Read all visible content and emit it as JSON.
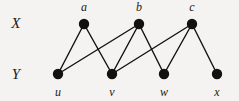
{
  "figure": {
    "type": "bipartite-graph",
    "background_color": "#f4f3f1",
    "ink_color": "#111111",
    "width": 239,
    "height": 101
  },
  "set_labels": [
    {
      "id": "X",
      "text": "X",
      "x": 16,
      "y": 23
    },
    {
      "id": "Y",
      "text": "Y",
      "x": 16,
      "y": 74
    }
  ],
  "vertices": {
    "top": [
      {
        "id": "a",
        "label": "a",
        "cx": 84,
        "cy": 24,
        "r": 5.2,
        "label_x": 84,
        "label_y": 7
      },
      {
        "id": "b",
        "label": "b",
        "cx": 139,
        "cy": 24,
        "r": 5.2,
        "label_x": 139,
        "label_y": 7
      },
      {
        "id": "c",
        "label": "c",
        "cx": 192,
        "cy": 24,
        "r": 5.2,
        "label_x": 192,
        "label_y": 7
      }
    ],
    "bottom": [
      {
        "id": "u",
        "label": "u",
        "cx": 58,
        "cy": 74,
        "r": 5.2,
        "label_x": 58,
        "label_y": 92
      },
      {
        "id": "v",
        "label": "v",
        "cx": 112,
        "cy": 74,
        "r": 5.2,
        "label_x": 112,
        "label_y": 92
      },
      {
        "id": "w",
        "label": "w",
        "cx": 164,
        "cy": 74,
        "r": 5.2,
        "label_x": 164,
        "label_y": 92
      },
      {
        "id": "x",
        "label": "x",
        "cx": 217,
        "cy": 74,
        "r": 5.2,
        "label_x": 217,
        "label_y": 92
      }
    ]
  },
  "edges": [
    {
      "from": "a",
      "to": "u",
      "x1": 84,
      "y1": 24,
      "x2": 58,
      "y2": 74
    },
    {
      "from": "a",
      "to": "v",
      "x1": 84,
      "y1": 24,
      "x2": 112,
      "y2": 74
    },
    {
      "from": "b",
      "to": "u",
      "x1": 139,
      "y1": 24,
      "x2": 58,
      "y2": 74
    },
    {
      "from": "b",
      "to": "v",
      "x1": 139,
      "y1": 24,
      "x2": 112,
      "y2": 74
    },
    {
      "from": "b",
      "to": "w",
      "x1": 139,
      "y1": 24,
      "x2": 164,
      "y2": 74
    },
    {
      "from": "c",
      "to": "v",
      "x1": 192,
      "y1": 24,
      "x2": 112,
      "y2": 74
    },
    {
      "from": "c",
      "to": "w",
      "x1": 192,
      "y1": 24,
      "x2": 164,
      "y2": 74
    },
    {
      "from": "c",
      "to": "x",
      "x1": 192,
      "y1": 24,
      "x2": 217,
      "y2": 74
    }
  ],
  "style": {
    "edge_width": 1.4
  }
}
